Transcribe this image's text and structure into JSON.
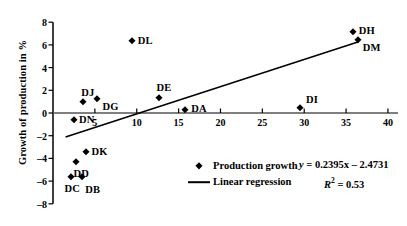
{
  "chart_data": {
    "type": "scatter",
    "title": "",
    "xlabel": "",
    "ylabel": "Growth of production in %",
    "xlim": [
      0,
      41.2
    ],
    "ylim": [
      -8,
      8
    ],
    "xticks": [
      5,
      10,
      15,
      20,
      25,
      30,
      35,
      40
    ],
    "xtick_labels": [
      "5",
      "10",
      "15",
      "20",
      "25",
      "30",
      "35",
      "40"
    ],
    "yticks": [
      -8,
      -6,
      -4,
      -2,
      0,
      2,
      4,
      6,
      8
    ],
    "ytick_labels": [
      "–8",
      "–6",
      "–4",
      "–2",
      "0",
      "2",
      "4",
      "6",
      "8"
    ],
    "grid": false,
    "legend_position": "lower-center",
    "series": [
      {
        "name": "Production growth",
        "marker": "diamond",
        "color": "#000000",
        "points": [
          {
            "label": "DC",
            "x": 2.2,
            "y": -5.6
          },
          {
            "label": "DB",
            "x": 3.5,
            "y": -5.6
          },
          {
            "label": "DD",
            "x": 2.8,
            "y": -4.3
          },
          {
            "label": "DK",
            "x": 4.0,
            "y": -3.4
          },
          {
            "label": "DN",
            "x": 2.5,
            "y": -0.6
          },
          {
            "label": "DJ",
            "x": 3.6,
            "y": 0.95
          },
          {
            "label": "DG",
            "x": 5.3,
            "y": 1.2
          },
          {
            "label": "DL",
            "x": 9.4,
            "y": 6.35
          },
          {
            "label": "DE",
            "x": 12.6,
            "y": 1.35
          },
          {
            "label": "DA",
            "x": 15.8,
            "y": 0.3
          },
          {
            "label": "DI",
            "x": 29.5,
            "y": 0.4
          },
          {
            "label": "DH",
            "x": 35.8,
            "y": 7.15
          },
          {
            "label": "DM",
            "x": 36.4,
            "y": 6.45
          }
        ]
      }
    ],
    "regression": {
      "name": "Linear regression",
      "slope": 0.2395,
      "intercept": -2.4731,
      "r_squared": 0.53,
      "x_start": 1.5,
      "x_end": 36.5,
      "color": "#000000"
    },
    "annotations": {
      "equation": "y = 0.2395x – 2.4731",
      "equation_y": "y",
      "equation_body": " = 0.2395x – 2.4731",
      "r2_symbol": "R",
      "r2_exponent": "2",
      "r2_value": " = 0.53"
    }
  },
  "legend": {
    "items": [
      {
        "label": "Production growth",
        "marker": "diamond"
      },
      {
        "label": "Linear regression",
        "marker": "line"
      }
    ]
  }
}
